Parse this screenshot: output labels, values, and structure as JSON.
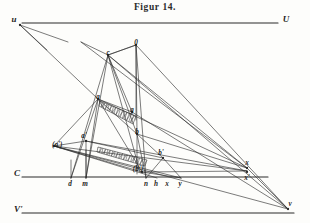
{
  "figure": {
    "title": "Figur 14.",
    "width": 310,
    "height": 223,
    "ink_color": "#2a2a2a",
    "paper_color": "#fdfdfb",
    "hatch_color": "#3a3a3a"
  },
  "points": {
    "u": {
      "x": 14,
      "y": 22,
      "label": "u"
    },
    "U": {
      "x": 286,
      "y": 22,
      "label": "U"
    },
    "O": {
      "x": 136,
      "y": 45,
      "label": "0"
    },
    "c": {
      "x": 108,
      "y": 55,
      "label": "c"
    },
    "a": {
      "x": 98,
      "y": 99,
      "label": "a"
    },
    "g": {
      "x": 132,
      "y": 112,
      "label": "g"
    },
    "b": {
      "x": 137,
      "y": 134,
      "label": "b"
    },
    "aprime": {
      "x": 84,
      "y": 138,
      "label": "a'"
    },
    "aparen": {
      "x": 52,
      "y": 147,
      "label": "(a')"
    },
    "bprime": {
      "x": 161,
      "y": 155,
      "label": "b'"
    },
    "bparen": {
      "x": 138,
      "y": 171,
      "label": "(b')"
    },
    "C": {
      "x": 14,
      "y": 176,
      "label": "C"
    },
    "d": {
      "x": 70,
      "y": 186,
      "label": "d"
    },
    "m": {
      "x": 85,
      "y": 186,
      "label": "m"
    },
    "n": {
      "x": 146,
      "y": 186,
      "label": "n"
    },
    "h": {
      "x": 156,
      "y": 186,
      "label": "h"
    },
    "x_low": {
      "x": 167,
      "y": 186,
      "label": "x"
    },
    "y": {
      "x": 180,
      "y": 186,
      "label": "y"
    },
    "x": {
      "x": 247,
      "y": 165,
      "label": "x"
    },
    "xprime": {
      "x": 247,
      "y": 180,
      "label": "x'"
    },
    "Vprime": {
      "x": 14,
      "y": 212,
      "label": "V'"
    },
    "v": {
      "x": 290,
      "y": 206,
      "label": "v"
    }
  },
  "horizontal_lines": [
    {
      "name": "line-U",
      "x1": 22,
      "y1": 23,
      "x2": 278,
      "y2": 23
    },
    {
      "name": "line-C",
      "x1": 22,
      "y1": 177,
      "x2": 268,
      "y2": 177
    },
    {
      "name": "line-Vprime",
      "x1": 22,
      "y1": 213,
      "x2": 294,
      "y2": 213
    }
  ],
  "segments": [
    {
      "name": "u-ray-1",
      "x1": 20,
      "y1": 25,
      "x2": 68,
      "y2": 42
    },
    {
      "name": "u-ray-2",
      "x1": 20,
      "y1": 25,
      "x2": 47,
      "y2": 50
    },
    {
      "name": "u-to-a",
      "x1": 20,
      "y1": 25,
      "x2": 98,
      "y2": 99
    },
    {
      "name": "c-to-O",
      "x1": 108,
      "y1": 55,
      "x2": 136,
      "y2": 45
    },
    {
      "name": "c-upleft",
      "x1": 108,
      "y1": 55,
      "x2": 81,
      "y2": 42
    },
    {
      "name": "O-to-b",
      "x1": 136,
      "y1": 45,
      "x2": 137,
      "y2": 134
    },
    {
      "name": "O-to-n",
      "x1": 136,
      "y1": 45,
      "x2": 146,
      "y2": 178
    },
    {
      "name": "O-to-c-down",
      "x1": 136,
      "y1": 45,
      "x2": 108,
      "y2": 55
    },
    {
      "name": "c-to-b",
      "x1": 108,
      "y1": 55,
      "x2": 137,
      "y2": 134
    },
    {
      "name": "c-to-bparen",
      "x1": 108,
      "y1": 55,
      "x2": 140,
      "y2": 172
    },
    {
      "name": "c-to-m",
      "x1": 108,
      "y1": 55,
      "x2": 86,
      "y2": 178
    },
    {
      "name": "c-to-d",
      "x1": 108,
      "y1": 55,
      "x2": 71,
      "y2": 178
    },
    {
      "name": "c-to-g",
      "x1": 108,
      "y1": 55,
      "x2": 132,
      "y2": 112
    },
    {
      "name": "a-to-g",
      "x1": 98,
      "y1": 99,
      "x2": 132,
      "y2": 112
    },
    {
      "name": "a-to-b",
      "x1": 98,
      "y1": 99,
      "x2": 137,
      "y2": 134
    },
    {
      "name": "a-to-x",
      "x1": 98,
      "y1": 99,
      "x2": 247,
      "y2": 168
    },
    {
      "name": "a-to-aparen",
      "x1": 98,
      "y1": 99,
      "x2": 54,
      "y2": 146
    },
    {
      "name": "a-to-d",
      "x1": 98,
      "y1": 99,
      "x2": 71,
      "y2": 178
    },
    {
      "name": "a-to-m",
      "x1": 98,
      "y1": 99,
      "x2": 86,
      "y2": 178
    },
    {
      "name": "a-to-bparen",
      "x1": 98,
      "y1": 99,
      "x2": 142,
      "y2": 172
    },
    {
      "name": "O-to-v",
      "x1": 136,
      "y1": 45,
      "x2": 288,
      "y2": 209
    },
    {
      "name": "c-to-v",
      "x1": 108,
      "y1": 55,
      "x2": 288,
      "y2": 209
    },
    {
      "name": "c-to-x",
      "x1": 108,
      "y1": 55,
      "x2": 247,
      "y2": 168
    },
    {
      "name": "upper-long-to-x",
      "x1": 81,
      "y1": 42,
      "x2": 247,
      "y2": 168
    },
    {
      "name": "aprime-to-aparen",
      "x1": 86,
      "y1": 141,
      "x2": 54,
      "y2": 146
    },
    {
      "name": "aprime-to-bprime",
      "x1": 86,
      "y1": 141,
      "x2": 163,
      "y2": 158
    },
    {
      "name": "aprime-to-m",
      "x1": 86,
      "y1": 141,
      "x2": 86,
      "y2": 178
    },
    {
      "name": "aprime-to-x",
      "x1": 86,
      "y1": 141,
      "x2": 247,
      "y2": 171
    },
    {
      "name": "aparen-to-x",
      "x1": 54,
      "y1": 146,
      "x2": 247,
      "y2": 171
    },
    {
      "name": "aparen-to-bparen",
      "x1": 54,
      "y1": 146,
      "x2": 142,
      "y2": 172
    },
    {
      "name": "aparen-to-y",
      "x1": 54,
      "y1": 146,
      "x2": 181,
      "y2": 178
    },
    {
      "name": "aparen-to-h",
      "x1": 54,
      "y1": 146,
      "x2": 157,
      "y2": 178
    },
    {
      "name": "b-to-n",
      "x1": 137,
      "y1": 134,
      "x2": 146,
      "y2": 178
    },
    {
      "name": "b-to-bprime",
      "x1": 137,
      "y1": 134,
      "x2": 163,
      "y2": 158
    },
    {
      "name": "b-to-x",
      "x1": 137,
      "y1": 134,
      "x2": 247,
      "y2": 168
    },
    {
      "name": "bprime-to-n",
      "x1": 163,
      "y1": 158,
      "x2": 146,
      "y2": 178
    },
    {
      "name": "bprime-to-y",
      "x1": 163,
      "y1": 158,
      "x2": 181,
      "y2": 178
    },
    {
      "name": "bparen-to-x",
      "x1": 142,
      "y1": 172,
      "x2": 247,
      "y2": 171
    },
    {
      "name": "bparen-to-y",
      "x1": 142,
      "y1": 172,
      "x2": 181,
      "y2": 178
    },
    {
      "name": "g-to-v",
      "x1": 132,
      "y1": 112,
      "x2": 288,
      "y2": 209
    },
    {
      "name": "x-to-v",
      "x1": 247,
      "y1": 168,
      "x2": 288,
      "y2": 209
    },
    {
      "name": "aparen-to-v",
      "x1": 54,
      "y1": 146,
      "x2": 288,
      "y2": 209
    },
    {
      "name": "d-vertical",
      "x1": 71,
      "y1": 160,
      "x2": 71,
      "y2": 178
    },
    {
      "name": "m-vertical",
      "x1": 86,
      "y1": 150,
      "x2": 86,
      "y2": 178
    },
    {
      "name": "b-vertical-down",
      "x1": 137,
      "y1": 134,
      "x2": 137,
      "y2": 174
    },
    {
      "name": "O-vertical-down",
      "x1": 136,
      "y1": 45,
      "x2": 136,
      "y2": 120
    }
  ],
  "hatched_strips": [
    {
      "name": "upper-hatched-strip",
      "p1": {
        "x": 100,
        "y": 101
      },
      "p2": {
        "x": 136,
        "y": 116
      },
      "p3": {
        "x": 133,
        "y": 124
      },
      "p4": {
        "x": 99,
        "y": 106
      },
      "hatch_count": 16
    },
    {
      "name": "lower-hatched-strip",
      "p1": {
        "x": 98,
        "y": 147
      },
      "p2": {
        "x": 147,
        "y": 160
      },
      "p3": {
        "x": 145,
        "y": 166
      },
      "p4": {
        "x": 97,
        "y": 152
      },
      "hatch_count": 20
    }
  ]
}
